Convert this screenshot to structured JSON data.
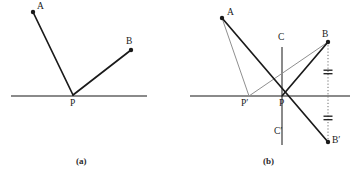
{
  "figure": {
    "panels": [
      {
        "id": "a",
        "caption": "(a)",
        "caption_pos": {
          "x": 76,
          "y": 156
        },
        "mirror_line": {
          "x1": 11,
          "y1": 96,
          "x2": 147,
          "y2": 96,
          "color": "#8a8a8a"
        },
        "points": [
          {
            "name": "A",
            "label": "A",
            "x": 33,
            "y": 12,
            "label_x": 37,
            "label_y": 2,
            "dot": true
          },
          {
            "name": "B",
            "label": "B",
            "x": 131,
            "y": 50,
            "label_x": 126,
            "label_y": 37,
            "dot": true
          },
          {
            "name": "P",
            "label": "P",
            "x": 73,
            "y": 95,
            "label_x": 70,
            "label_y": 99,
            "dot": false
          }
        ],
        "segments": [
          {
            "name": "A-P",
            "from": "A",
            "to": "P",
            "color": "#1a1a1a",
            "width": 1.7,
            "dashed": false
          },
          {
            "name": "P-B",
            "from": "P",
            "to": "B",
            "color": "#1a1a1a",
            "width": 1.7,
            "dashed": false
          }
        ]
      },
      {
        "id": "b",
        "caption": "(b)",
        "caption_pos": {
          "x": 263,
          "y": 156
        },
        "mirror_line": {
          "x1": 190,
          "y1": 96,
          "x2": 350,
          "y2": 96,
          "color": "#8a8a8a"
        },
        "normal_line": {
          "x1": 282,
          "y1": 47,
          "x2": 282,
          "y2": 145,
          "color": "#8a8a8a"
        },
        "points": [
          {
            "name": "A",
            "label": "A",
            "x": 222,
            "y": 18,
            "label_x": 227,
            "label_y": 8,
            "dot": true
          },
          {
            "name": "B",
            "label": "B",
            "x": 328,
            "y": 42,
            "label_x": 322,
            "label_y": 30,
            "dot": true
          },
          {
            "name": "Bprime",
            "label": "B′",
            "x": 328,
            "y": 142,
            "label_x": 332,
            "label_y": 136,
            "dot": true
          },
          {
            "name": "P",
            "label": "P",
            "x": 282,
            "y": 96,
            "label_x": 279,
            "label_y": 99,
            "dot": false
          },
          {
            "name": "Pprime",
            "label": "P′",
            "x": 249,
            "y": 96,
            "label_x": 244,
            "label_y": 99,
            "dot": false
          },
          {
            "name": "C",
            "label": "C",
            "x": 282,
            "y": 47,
            "label_x": 278,
            "label_y": 33,
            "dot": false
          },
          {
            "name": "Cprime",
            "label": "C′",
            "x": 282,
            "y": 145,
            "label_x": 276,
            "label_y": 127,
            "dot": false
          }
        ],
        "segments": [
          {
            "name": "A-P",
            "from": "A",
            "to": "P",
            "color": "#1a1a1a",
            "width": 1.7,
            "dashed": false
          },
          {
            "name": "P-B",
            "from": "P",
            "to": "B",
            "color": "#1a1a1a",
            "width": 1.7,
            "dashed": false
          },
          {
            "name": "A-Pprime",
            "from": "A",
            "to": "Pprime",
            "color": "#8f8f8f",
            "width": 1.0,
            "dashed": false
          },
          {
            "name": "Pprime-B",
            "from": "Pprime",
            "to": "B",
            "color": "#8f8f8f",
            "width": 1.0,
            "dashed": false
          },
          {
            "name": "A-Bprime",
            "from": "A",
            "to": "Bprime",
            "color": "#1a1a1a",
            "width": 1.7,
            "dashed": false
          }
        ],
        "dotted_drop": {
          "name": "B-Bprime-dotted",
          "x": 328,
          "y1": 42,
          "y2": 142,
          "color": "#6f6f6f"
        },
        "tick_marks": [
          {
            "name": "equal-tick-upper",
            "x": 328,
            "y": 72,
            "width": 9,
            "gap": 3.5
          },
          {
            "name": "equal-tick-lower",
            "x": 328,
            "y": 118,
            "width": 9,
            "gap": 3.5
          }
        ]
      }
    ]
  },
  "colors": {
    "ink": "#1a1a1a",
    "construction": "#8f8f8f",
    "mirror": "#8a8a8a",
    "dotted": "#6f6f6f",
    "background": "#ffffff"
  }
}
